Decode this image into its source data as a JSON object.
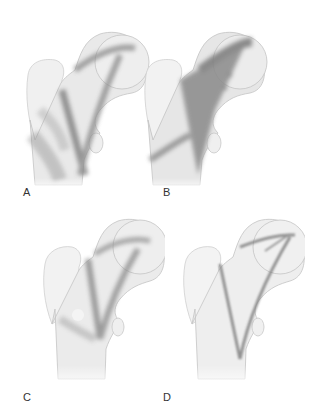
{
  "figure": {
    "panels": [
      {
        "id": "A",
        "label": "A",
        "pattern": "diffuse-moderate"
      },
      {
        "id": "B",
        "label": "B",
        "pattern": "dense-dark"
      },
      {
        "id": "C",
        "label": "C",
        "pattern": "patchy-mixed"
      },
      {
        "id": "D",
        "label": "D",
        "pattern": "sparse-thin-lines"
      }
    ],
    "colors": {
      "bone_fill": "#ededed",
      "bone_outline": "#c8c8c8",
      "trabecular_dark": "#7a7a7a",
      "background": "#ffffff"
    }
  }
}
